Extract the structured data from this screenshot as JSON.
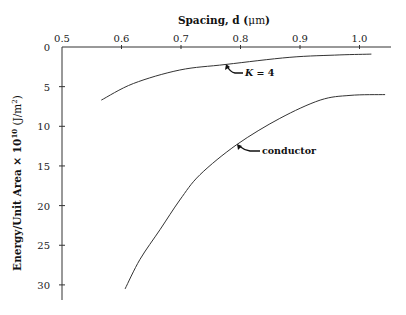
{
  "chart_data": {
    "type": "line",
    "title": "",
    "xlabel": "Spacing, d (μm)",
    "ylabel": "Energy/Unit Area × 10^10 (J/m²)",
    "xlabel_parts": {
      "main": "Spacing, d (",
      "unit": "μm",
      "close": ")"
    },
    "ylabel_parts": {
      "main": "Energy/Unit Area × 10",
      "exp": "10",
      "unit_open": " (J/m",
      "unit_exp": "2",
      "unit_close": ")"
    },
    "x_axis_position": "top",
    "y_axis_inverted": true,
    "xlim": [
      0.5,
      1.06
    ],
    "ylim": [
      0,
      32
    ],
    "x_ticks": [
      0.5,
      0.6,
      0.7,
      0.8,
      0.9,
      1.0
    ],
    "x_tick_labels": [
      "0.5",
      "0.6",
      "0.7",
      "0.8",
      "0.9",
      "1.0"
    ],
    "y_ticks": [
      0,
      5,
      10,
      15,
      20,
      25,
      30
    ],
    "y_tick_labels": [
      "0",
      "5",
      "10",
      "15",
      "20",
      "25",
      "30"
    ],
    "grid": false,
    "legend": null,
    "series": [
      {
        "name": "K = 4",
        "x": [
          0.566,
          0.62,
          0.698,
          0.776,
          0.883,
          0.967,
          1.02
        ],
        "values": [
          6.7,
          4.6,
          2.9,
          2.2,
          1.3,
          1.0,
          0.9
        ]
      },
      {
        "name": "conductor",
        "x": [
          0.606,
          0.631,
          0.665,
          0.698,
          0.732,
          0.794,
          0.866,
          0.934,
          0.984,
          1.043
        ],
        "values": [
          30.5,
          26.8,
          23.0,
          19.3,
          16.1,
          12.3,
          9.0,
          6.7,
          6.1,
          6.0
        ]
      }
    ],
    "annotations": [
      {
        "text_main": "K",
        "text_rest": " = 4",
        "points_to_series": "K = 4",
        "arrow_at": [
          0.776,
          2.2
        ]
      },
      {
        "text": "conductor",
        "points_to_series": "conductor",
        "arrow_at": [
          0.794,
          12.3
        ]
      }
    ]
  }
}
